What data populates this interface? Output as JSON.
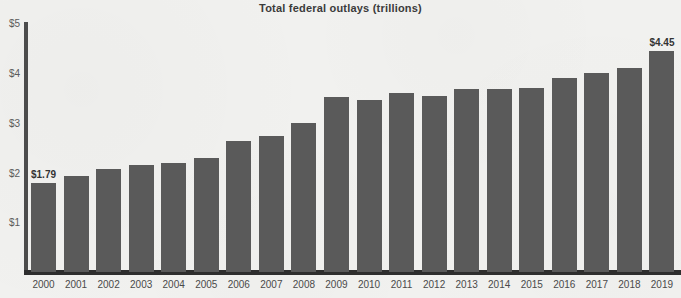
{
  "chart_data": {
    "type": "bar",
    "title": "Total federal outlays (trillions)",
    "xlabel": "",
    "ylabel": "",
    "ylim": [
      0,
      5
    ],
    "grid": false,
    "legend": null,
    "y_ticks": [
      "$5",
      "$4",
      "$3",
      "$2",
      "$1"
    ],
    "y_tick_values": [
      5,
      4,
      3,
      2,
      1
    ],
    "categories": [
      "2000",
      "2001",
      "2002",
      "2003",
      "2004",
      "2005",
      "2006",
      "2007",
      "2008",
      "2009",
      "2010",
      "2011",
      "2012",
      "2013",
      "2014",
      "2015",
      "2016",
      "2017",
      "2018",
      "2019"
    ],
    "values": [
      1.79,
      1.92,
      2.07,
      2.16,
      2.2,
      2.29,
      2.63,
      2.73,
      3.0,
      3.52,
      3.46,
      3.6,
      3.53,
      3.68,
      3.68,
      3.69,
      3.89,
      4.01,
      4.11,
      4.45
    ],
    "annotations": [
      {
        "category": "2000",
        "text": "$1.79"
      },
      {
        "category": "2019",
        "text": "$4.45"
      }
    ],
    "colors": {
      "bar": "#5a5a5a",
      "background": "#f1f1ef",
      "axis": "#2e2e2e",
      "text": "#3b3b3b"
    }
  }
}
